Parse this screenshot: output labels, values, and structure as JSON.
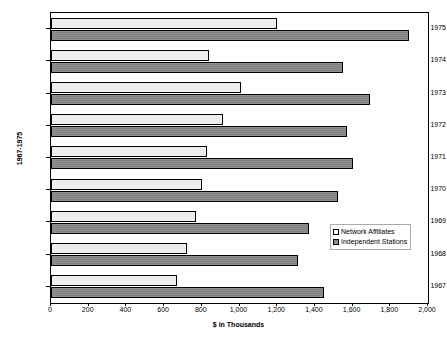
{
  "chart_data": {
    "type": "bar",
    "orientation": "horizontal",
    "title": "",
    "xlabel": "$ in Thousands",
    "ylabel": "1967-1975",
    "categories": [
      "1967",
      "1968",
      "1969",
      "1970",
      "1971",
      "1972",
      "1973",
      "1974",
      "1975"
    ],
    "series": [
      {
        "name": "Network Affiliates",
        "color": "#ededed",
        "values": [
          670,
          720,
          770,
          800,
          830,
          910,
          1010,
          840,
          1200
        ]
      },
      {
        "name": "Independent Stations",
        "color": "#808080",
        "values": [
          1450,
          1310,
          1370,
          1520,
          1600,
          1570,
          1690,
          1550,
          1900
        ]
      }
    ],
    "xlim": [
      0,
      2000
    ],
    "xticks": [
      0,
      200,
      400,
      600,
      800,
      1000,
      1200,
      1400,
      1600,
      1800,
      2000
    ],
    "xtick_labels": [
      "0",
      "200",
      "400",
      "600",
      "800",
      "1,000",
      "1,200",
      "1,400",
      "1,600",
      "1,800",
      "2,000"
    ],
    "grid": false,
    "legend_position": "center-right",
    "legend": [
      {
        "label": "Network Affiliates",
        "swatch": "affiliates"
      },
      {
        "label": "Independent Stations",
        "swatch": "independents"
      }
    ]
  }
}
